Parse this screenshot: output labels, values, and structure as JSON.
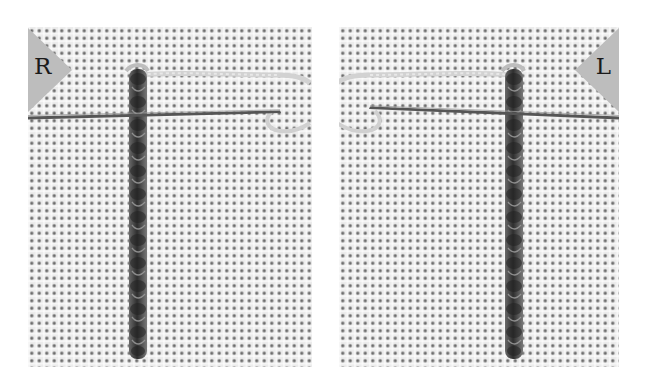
{
  "figure": {
    "color_mode": "grayscale",
    "colors": {
      "background": "#ffffff",
      "fabric": "#ececec",
      "fabric_holes": "#5a5a5a",
      "badge": "#bdbdbd",
      "letter": "#1a1a1a",
      "stitch_dark": "#3a3a3a",
      "stitch_light": "#8a8a8a",
      "needle": "#555555",
      "loose_thread": "#cfcfcf"
    },
    "panels": [
      {
        "id": "left",
        "badge_label": "R",
        "badge_position": "top-left",
        "needle_direction": "pointing right"
      },
      {
        "id": "right",
        "badge_label": "L",
        "badge_position": "top-right",
        "needle_direction": "pointing left"
      }
    ]
  }
}
